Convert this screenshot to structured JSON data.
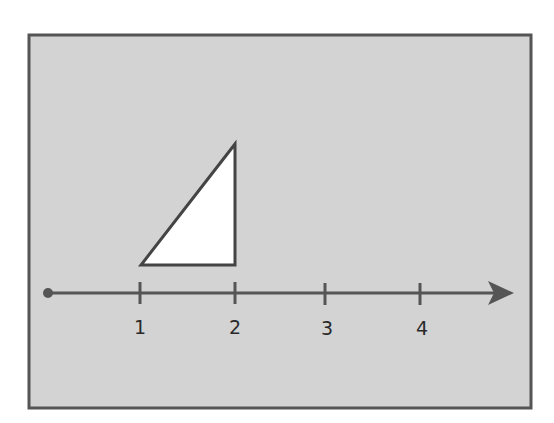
{
  "diagram": {
    "type": "number-line-with-triangle",
    "colors": {
      "panel_fill": "#d3d3d3",
      "panel_border": "#555555",
      "line": "#555555",
      "triangle_fill": "#ffffff",
      "triangle_stroke": "#444444",
      "label": "#2a2a2a"
    },
    "number_line": {
      "start_marker": "dot",
      "end_marker": "arrow",
      "ticks": [
        {
          "value": 1,
          "label": "1"
        },
        {
          "value": 2,
          "label": "2"
        },
        {
          "value": 3,
          "label": "3"
        },
        {
          "value": 4,
          "label": "4"
        }
      ]
    },
    "triangle": {
      "kind": "right-triangle",
      "base_from": 1,
      "base_to": 2,
      "right_angle_at": "bottom-right"
    }
  }
}
